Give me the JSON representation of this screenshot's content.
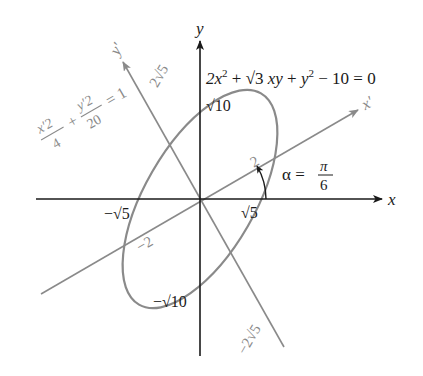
{
  "figure": {
    "equation": "2x² + √3 xy + y² − 10 = 0",
    "equation_parts": {
      "a": "2x",
      "a_sup": "2",
      "plus1": " + ",
      "sqrt3": "√3",
      "xy": " xy",
      "plus2": " + ",
      "y": "y",
      "y_sup": "2",
      "rest": " − 10 = 0"
    },
    "rotated_equation": {
      "num1": "x′2",
      "den1": "4",
      "plus": "+",
      "num2": "y′2",
      "den2": "20",
      "eq": "= 1"
    },
    "angle_label": {
      "alpha": "α =",
      "num": "π",
      "den": "6"
    },
    "axes": {
      "x": "x",
      "y": "y",
      "x_prime": "x′",
      "y_prime": "y′"
    },
    "tick_labels": {
      "sqrt5_pos": "√5",
      "sqrt5_neg": "−√5",
      "sqrt10_pos": "√10",
      "sqrt10_neg": "−√10",
      "two_pos": "2",
      "two_neg": "−2",
      "two_sqrt5_pos": "2√5",
      "two_sqrt5_neg": "−2√5"
    },
    "colors": {
      "axis": "#1a1a1a",
      "rotated": "#8a8a8a",
      "ellipse": "#8a8a8a",
      "text": "#1a1a1a",
      "rotated_text": "#8a8a8a"
    }
  }
}
